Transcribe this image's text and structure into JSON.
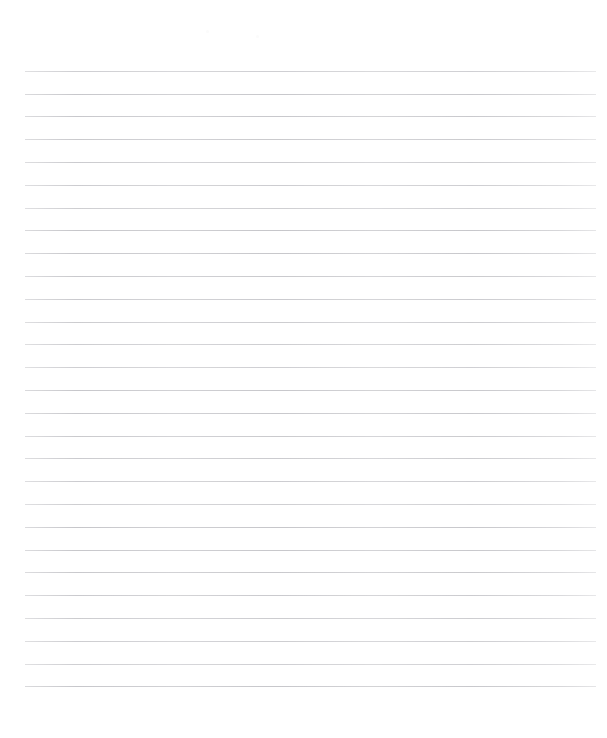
{
  "document": {
    "type": "lined-paper",
    "title": "Blank ruled notebook page",
    "page_width": 607,
    "page_height": 738,
    "background_color": "#ffffff",
    "text_content": "",
    "has_written_text": false
  },
  "ruling": {
    "line_color": "#c6c6ca",
    "line_thickness": 1,
    "line_count": 28,
    "line_spacing": 22.8,
    "first_line_y": 70.7,
    "last_line_y": 700.3,
    "line_left_x": 25,
    "line_right_x": 596,
    "line_width": 571,
    "margin_top": 70,
    "margin_bottom": 38,
    "margin_left": 25,
    "margin_right": 11,
    "has_vertical_margin_rule": false,
    "has_holes": false
  },
  "artifacts": [
    {
      "name": "scan-speck-left",
      "x": 206,
      "y": 30,
      "size": 3
    },
    {
      "name": "scan-speck-right",
      "x": 256,
      "y": 35,
      "size": 3
    }
  ]
}
